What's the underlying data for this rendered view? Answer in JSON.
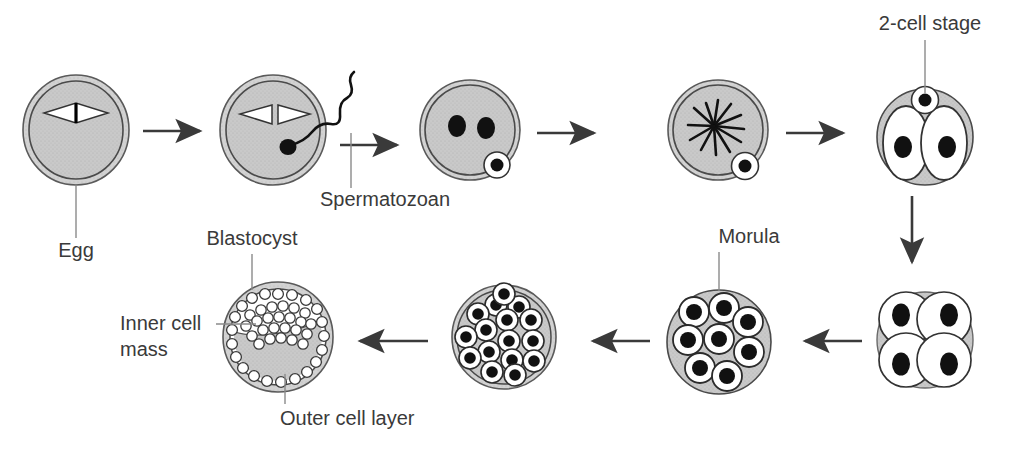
{
  "diagram": {
    "colors": {
      "cytoplasm": "#c9c9c9",
      "zona": "#d6d6d6",
      "outline": "#444444",
      "nucleus": "#000000",
      "cell_fill": "#ffffff",
      "arrow": "#3a3a3a",
      "leader_line": "#808080",
      "text": "#3a3a3a",
      "background": "#ffffff"
    },
    "labels": [
      {
        "id": "egg",
        "text": "Egg",
        "x": 76,
        "y": 257,
        "anchor": "middle",
        "leader": {
          "x1": 76,
          "y1": 168,
          "x2": 76,
          "y2": 238
        }
      },
      {
        "id": "spermatozoan",
        "text": "Spermatozoan",
        "x": 320,
        "y": 206,
        "anchor": "start",
        "leader": {
          "x1": 351,
          "y1": 131,
          "x2": 351,
          "y2": 188
        }
      },
      {
        "id": "two-cell-stage",
        "text": "2-cell stage",
        "x": 930,
        "y": 30,
        "anchor": "middle",
        "leader": {
          "x1": 925,
          "y1": 40,
          "x2": 925,
          "y2": 93
        }
      },
      {
        "id": "morula",
        "text": "Morula",
        "x": 749,
        "y": 243,
        "anchor": "middle",
        "leader": {
          "x1": 719,
          "y1": 252,
          "x2": 719,
          "y2": 290
        }
      },
      {
        "id": "blastocyst",
        "text": "Blastocyst",
        "x": 252,
        "y": 245,
        "anchor": "middle",
        "leader": {
          "x1": 252,
          "y1": 254,
          "x2": 252,
          "y2": 288
        }
      },
      {
        "id": "inner-cell-mass-line1",
        "text": "Inner cell",
        "x": 120,
        "y": 330,
        "anchor": "start",
        "leader": {
          "x1": 215,
          "y1": 324,
          "x2": 253,
          "y2": 324
        }
      },
      {
        "id": "inner-cell-mass-line2",
        "text": "mass",
        "x": 120,
        "y": 356,
        "anchor": "start",
        "leader": null
      },
      {
        "id": "outer-cell-layer",
        "text": "Outer cell layer",
        "x": 280,
        "y": 425,
        "anchor": "start",
        "leader": {
          "x1": 285,
          "y1": 375,
          "x2": 285,
          "y2": 404
        }
      }
    ],
    "stages": [
      {
        "id": "egg",
        "order": 1,
        "cx": 76,
        "cy": 130,
        "r": 53,
        "type": "egg",
        "description": "Unfertilized egg with zona pellucida and meiotic spindle"
      },
      {
        "id": "fertilization",
        "order": 2,
        "cx": 273,
        "cy": 130,
        "r": 53,
        "type": "fertilized",
        "description": "Egg penetrated by spermatozoan"
      },
      {
        "id": "pronuclei",
        "order": 3,
        "cx": 470,
        "cy": 130,
        "r": 50,
        "type": "pronuclei",
        "description": "Zygote with two pronuclei and polar body"
      },
      {
        "id": "spindle",
        "order": 4,
        "cx": 718,
        "cy": 130,
        "r": 50,
        "type": "spindle",
        "description": "First cleavage spindle (aster)"
      },
      {
        "id": "two-cell",
        "order": 5,
        "cx": 925,
        "cy": 137,
        "r": 48,
        "type": "two-cell",
        "description": "2-cell stage with polar body"
      },
      {
        "id": "four-cell",
        "order": 6,
        "cx": 925,
        "cy": 340,
        "r": 48,
        "type": "four-cell",
        "description": "4-cell stage"
      },
      {
        "id": "morula-early",
        "order": 7,
        "cx": 719,
        "cy": 342,
        "r": 52,
        "type": "morula-early",
        "description": "Morula, approximately 9 blastomeres"
      },
      {
        "id": "morula-late",
        "order": 8,
        "cx": 504,
        "cy": 337,
        "r": 52,
        "type": "morula-late",
        "description": "Late morula, approximately 18 blastomeres"
      },
      {
        "id": "blastocyst",
        "order": 9,
        "cx": 278,
        "cy": 337,
        "r": 55,
        "type": "blastocyst",
        "description": "Blastocyst with inner cell mass, outer cell layer and blastocoel"
      }
    ],
    "arrows": [
      {
        "id": "arrow-1",
        "direction": "right",
        "x1": 143,
        "y1": 131,
        "x2": 207,
        "y2": 131
      },
      {
        "id": "arrow-2",
        "direction": "right",
        "x1": 340,
        "y1": 145,
        "x2": 404,
        "y2": 145
      },
      {
        "id": "arrow-3",
        "direction": "right",
        "x1": 537,
        "y1": 133,
        "x2": 601,
        "y2": 133
      },
      {
        "id": "arrow-4",
        "direction": "right",
        "x1": 786,
        "y1": 133,
        "x2": 850,
        "y2": 133
      },
      {
        "id": "arrow-5",
        "direction": "down",
        "x1": 912,
        "y1": 196,
        "x2": 912,
        "y2": 268
      },
      {
        "id": "arrow-6",
        "direction": "left",
        "x1": 862,
        "y1": 341,
        "x2": 798,
        "y2": 341
      },
      {
        "id": "arrow-7",
        "direction": "left",
        "x1": 650,
        "y1": 341,
        "x2": 586,
        "y2": 341
      },
      {
        "id": "arrow-8",
        "direction": "left",
        "x1": 428,
        "y1": 341,
        "x2": 353,
        "y2": 341
      }
    ]
  }
}
